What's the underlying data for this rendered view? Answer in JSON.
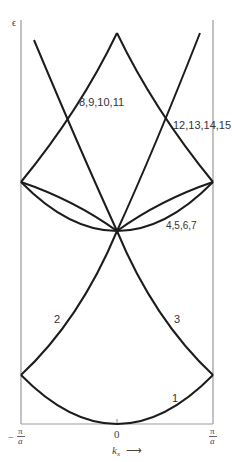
{
  "diagram": {
    "y_axis_label": "ϵ",
    "x_axis_label": "k",
    "x_axis_subscript": "x",
    "x_axis_arrow": "⟶",
    "x_ticks": {
      "left": {
        "sign": "−",
        "num": "π",
        "den": "a"
      },
      "center": "0",
      "right": {
        "num": "π",
        "den": "a"
      }
    },
    "band_labels": {
      "b1": "1",
      "b2": "2",
      "b3": "3",
      "b4": "4,5,6,7",
      "b8": "8,9,10,11",
      "b12": "12,13,14,15"
    },
    "colors": {
      "curve": "#1c1c1c",
      "axis": "#9a9a9a",
      "text": "#333333"
    }
  }
}
